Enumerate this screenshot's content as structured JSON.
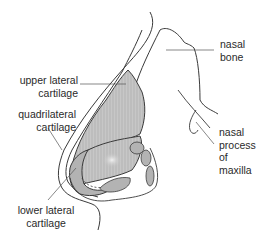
{
  "diagram": {
    "colors": {
      "outline": "#3a3a3a",
      "cartilage_fill": "#bdbdbd",
      "cartilage_highlight": "#e6e6e6",
      "leader_line": "#555555",
      "text": "#2a2a2a"
    },
    "labels": {
      "nasal_bone": "nasal\nbone",
      "upper_lateral_cartilage": "upper lateral\ncartilage",
      "quadrilateral_cartilage": "quadrilateral\ncartilage",
      "nasal_process_of_maxilla": "nasal\nprocess\nof\nmaxilla",
      "lower_lateral_cartilage": "lower lateral\ncartilage"
    }
  }
}
